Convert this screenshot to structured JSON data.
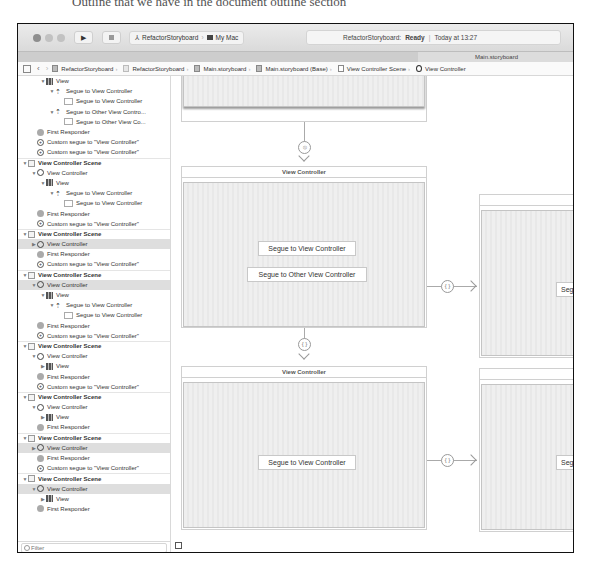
{
  "caption_fragment": "Outline that we have in the document outline section",
  "toolbar": {
    "run_icon": "play-icon",
    "stop_icon": "stop-icon",
    "scheme": "RefactorStoryboard",
    "destination": "My Mac",
    "activity": {
      "project": "RefactorStoryboard:",
      "status": "Ready",
      "time": "Today at 13:27"
    }
  },
  "tab": {
    "label": "Main.storyboard"
  },
  "jumpbar": {
    "crumbs": [
      "RefactorStoryboard",
      "RefactorStoryboard",
      "Main.storyboard",
      "Main.storyboard (Base)",
      "View Controller Scene",
      "View Controller"
    ]
  },
  "outline": {
    "rows": [
      {
        "indent": 2,
        "disc": "▼",
        "icon": "view",
        "label": "View",
        "type": "item"
      },
      {
        "indent": 3,
        "disc": "▼",
        "icon": "segue",
        "label": "Segue to View Controller",
        "type": "item"
      },
      {
        "indent": 4,
        "disc": "",
        "icon": "button",
        "label": "Segue to View Controller",
        "type": "item"
      },
      {
        "indent": 3,
        "disc": "▼",
        "icon": "segue",
        "label": "Segue to Other View Contro...",
        "type": "item"
      },
      {
        "indent": 4,
        "disc": "",
        "icon": "button",
        "label": "Segue to Other View Co...",
        "type": "item"
      },
      {
        "indent": 1,
        "disc": "",
        "icon": "fr",
        "label": "First Responder",
        "type": "item"
      },
      {
        "indent": 1,
        "disc": "",
        "icon": "custom",
        "label": "Custom segue to \"View Controller\"",
        "type": "item"
      },
      {
        "indent": 1,
        "disc": "",
        "icon": "custom",
        "label": "Custom segue to \"View Controller\"",
        "type": "item"
      },
      {
        "indent": 0,
        "disc": "▼",
        "icon": "scene",
        "label": "View Controller Scene",
        "type": "scene"
      },
      {
        "indent": 1,
        "disc": "▼",
        "icon": "vc",
        "label": "View Controller",
        "type": "item"
      },
      {
        "indent": 2,
        "disc": "▼",
        "icon": "view",
        "label": "View",
        "type": "item"
      },
      {
        "indent": 3,
        "disc": "▼",
        "icon": "segue",
        "label": "Segue to View Controller",
        "type": "item"
      },
      {
        "indent": 4,
        "disc": "",
        "icon": "button",
        "label": "Segue to View Controller",
        "type": "item"
      },
      {
        "indent": 1,
        "disc": "",
        "icon": "fr",
        "label": "First Responder",
        "type": "item"
      },
      {
        "indent": 1,
        "disc": "",
        "icon": "custom",
        "label": "Custom segue to \"View Controller\"",
        "type": "item"
      },
      {
        "indent": 0,
        "disc": "▼",
        "icon": "scene",
        "label": "View Controller Scene",
        "type": "scene"
      },
      {
        "indent": 1,
        "disc": "▶",
        "icon": "vc",
        "label": "View Controller",
        "type": "sel"
      },
      {
        "indent": 1,
        "disc": "",
        "icon": "fr",
        "label": "First Responder",
        "type": "item"
      },
      {
        "indent": 1,
        "disc": "",
        "icon": "custom",
        "label": "Custom segue to \"View Controller\"",
        "type": "item"
      },
      {
        "indent": 0,
        "disc": "▼",
        "icon": "scene",
        "label": "View Controller Scene",
        "type": "scene"
      },
      {
        "indent": 1,
        "disc": "▼",
        "icon": "vc",
        "label": "View Controller",
        "type": "sel"
      },
      {
        "indent": 2,
        "disc": "▼",
        "icon": "view",
        "label": "View",
        "type": "item"
      },
      {
        "indent": 3,
        "disc": "▼",
        "icon": "segue",
        "label": "Segue to View Controller",
        "type": "item"
      },
      {
        "indent": 4,
        "disc": "",
        "icon": "button",
        "label": "Segue to View Controller",
        "type": "item"
      },
      {
        "indent": 1,
        "disc": "",
        "icon": "fr",
        "label": "First Responder",
        "type": "item"
      },
      {
        "indent": 1,
        "disc": "",
        "icon": "custom",
        "label": "Custom segue to \"View Controller\"",
        "type": "item"
      },
      {
        "indent": 0,
        "disc": "▼",
        "icon": "scene",
        "label": "View Controller Scene",
        "type": "scene"
      },
      {
        "indent": 1,
        "disc": "▼",
        "icon": "vc",
        "label": "View Controller",
        "type": "item"
      },
      {
        "indent": 2,
        "disc": "▶",
        "icon": "view",
        "label": "View",
        "type": "item"
      },
      {
        "indent": 1,
        "disc": "",
        "icon": "fr",
        "label": "First Responder",
        "type": "item"
      },
      {
        "indent": 1,
        "disc": "",
        "icon": "custom",
        "label": "Custom segue to \"View Controller\"",
        "type": "item"
      },
      {
        "indent": 0,
        "disc": "▼",
        "icon": "scene",
        "label": "View Controller Scene",
        "type": "scene"
      },
      {
        "indent": 1,
        "disc": "▼",
        "icon": "vc",
        "label": "View Controller",
        "type": "item"
      },
      {
        "indent": 2,
        "disc": "▶",
        "icon": "view",
        "label": "View",
        "type": "item"
      },
      {
        "indent": 1,
        "disc": "",
        "icon": "fr",
        "label": "First Responder",
        "type": "item"
      },
      {
        "indent": 0,
        "disc": "▼",
        "icon": "scene",
        "label": "View Controller Scene",
        "type": "scene"
      },
      {
        "indent": 1,
        "disc": "▶",
        "icon": "vc",
        "label": "View Controller",
        "type": "sel"
      },
      {
        "indent": 1,
        "disc": "",
        "icon": "fr",
        "label": "First Responder",
        "type": "item"
      },
      {
        "indent": 1,
        "disc": "",
        "icon": "custom",
        "label": "Custom segue to \"View Controller\"",
        "type": "item"
      },
      {
        "indent": 0,
        "disc": "▼",
        "icon": "scene",
        "label": "View Controller Scene",
        "type": "scene"
      },
      {
        "indent": 1,
        "disc": "▼",
        "icon": "vc",
        "label": "View Controller",
        "type": "sel"
      },
      {
        "indent": 2,
        "disc": "▶",
        "icon": "view",
        "label": "View",
        "type": "item"
      },
      {
        "indent": 1,
        "disc": "",
        "icon": "fr",
        "label": "First Responder",
        "type": "item"
      }
    ],
    "filter_placeholder": "Filter"
  },
  "canvas": {
    "scene_title": "View Controller",
    "scene2_title": "View Controller",
    "btn_segue_vc": "Segue to View Controller",
    "btn_segue_other": "Segue to Other View Controller",
    "btn_segue_vc_2": "Segue to View Controller",
    "btn_cut_1": "Segue to View Controller",
    "btn_cut_2": "Segue to View Controller",
    "segue_glyph": "{ }"
  }
}
